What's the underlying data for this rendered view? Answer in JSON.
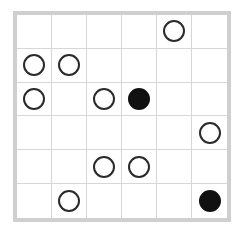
{
  "puzzle": {
    "type": "masyu",
    "rows": 6,
    "cols": 6,
    "colors": {
      "outer_border": "#cfcfcf",
      "grid_line": "#d6d6d6",
      "white_pearl_stroke": "#2a2a2a",
      "black_pearl_fill": "#111111",
      "background": "#ffffff"
    },
    "grid": [
      [
        "",
        "",
        "",
        "",
        "white",
        ""
      ],
      [
        "white",
        "white",
        "",
        "",
        "",
        ""
      ],
      [
        "white",
        "",
        "white",
        "black",
        "",
        ""
      ],
      [
        "",
        "",
        "",
        "",
        "",
        "white"
      ],
      [
        "",
        "",
        "white",
        "white",
        "",
        ""
      ],
      [
        "",
        "white",
        "",
        "",
        "",
        "black"
      ]
    ]
  }
}
